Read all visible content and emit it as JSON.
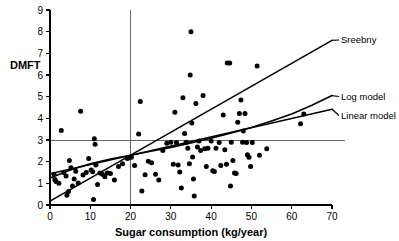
{
  "chart_data": {
    "type": "scatter",
    "title": "",
    "xlabel": "Sugar consumption (kg/year)",
    "ylabel": "DMFT",
    "xlim": [
      0,
      70
    ],
    "ylim": [
      0,
      9
    ],
    "xticks": [
      0,
      10,
      20,
      30,
      40,
      50,
      60,
      70
    ],
    "yticks": [
      0,
      1,
      2,
      3,
      4,
      5,
      6,
      7,
      8,
      9
    ],
    "grid": false,
    "legend_position": "right-inline-labels",
    "reference_lines": [
      {
        "name": "vertical-threshold",
        "orientation": "vertical",
        "value": 20
      },
      {
        "name": "horizontal-threshold",
        "orientation": "horizontal",
        "value": 3
      }
    ],
    "series": [
      {
        "name": "Sreebny",
        "type": "line",
        "label": "Sreebny",
        "points": [
          [
            0,
            0.18
          ],
          [
            70,
            7.6
          ]
        ]
      },
      {
        "name": "Log model",
        "type": "line",
        "label": "Log model",
        "points": [
          [
            0,
            1.25
          ],
          [
            5,
            1.62
          ],
          [
            10,
            1.9
          ],
          [
            15,
            2.12
          ],
          [
            20,
            2.3
          ],
          [
            25,
            2.48
          ],
          [
            30,
            2.66
          ],
          [
            35,
            2.86
          ],
          [
            40,
            3.08
          ],
          [
            45,
            3.32
          ],
          [
            50,
            3.58
          ],
          [
            55,
            3.88
          ],
          [
            60,
            4.2
          ],
          [
            65,
            4.6
          ],
          [
            70,
            5.05
          ]
        ]
      },
      {
        "name": "Linear model",
        "type": "line",
        "label": "Linear model",
        "points": [
          [
            0,
            1.44
          ],
          [
            70,
            4.42
          ]
        ]
      },
      {
        "name": "Countries",
        "type": "scatter",
        "label": "",
        "points": [
          [
            1.0,
            1.42
          ],
          [
            1.2,
            1.18
          ],
          [
            1.5,
            1.08
          ],
          [
            2.2,
            1.0
          ],
          [
            2.8,
            3.44
          ],
          [
            3.4,
            1.5
          ],
          [
            4.0,
            1.34
          ],
          [
            4.2,
            0.45
          ],
          [
            4.6,
            0.62
          ],
          [
            4.8,
            2.05
          ],
          [
            5.2,
            1.72
          ],
          [
            5.6,
            0.88
          ],
          [
            6.0,
            1.2
          ],
          [
            6.4,
            1.56
          ],
          [
            7.0,
            1.02
          ],
          [
            7.6,
            4.33
          ],
          [
            8.2,
            1.38
          ],
          [
            9.0,
            1.5
          ],
          [
            9.6,
            2.15
          ],
          [
            10.2,
            1.62
          ],
          [
            10.6,
            1.54
          ],
          [
            10.8,
            0.25
          ],
          [
            11.0,
            3.06
          ],
          [
            11.2,
            2.8
          ],
          [
            11.4,
            1.85
          ],
          [
            11.8,
            0.95
          ],
          [
            12.4,
            1.48
          ],
          [
            13.0,
            1.42
          ],
          [
            13.6,
            1.3
          ],
          [
            14.2,
            1.48
          ],
          [
            15.0,
            1.45
          ],
          [
            16.0,
            1.15
          ],
          [
            17.0,
            1.78
          ],
          [
            18.0,
            1.9
          ],
          [
            19.2,
            2.15
          ],
          [
            19.6,
            2.18
          ],
          [
            20.2,
            2.2
          ],
          [
            21.0,
            1.82
          ],
          [
            22.0,
            3.28
          ],
          [
            22.4,
            4.78
          ],
          [
            22.8,
            0.65
          ],
          [
            23.6,
            1.4
          ],
          [
            24.4,
            2.02
          ],
          [
            25.2,
            1.95
          ],
          [
            26.2,
            1.42
          ],
          [
            27.0,
            1.15
          ],
          [
            28.0,
            2.52
          ],
          [
            29.0,
            2.85
          ],
          [
            30.0,
            2.9
          ],
          [
            30.6,
            1.88
          ],
          [
            31.0,
            4.28
          ],
          [
            31.4,
            2.88
          ],
          [
            31.8,
            1.85
          ],
          [
            32.2,
            1.52
          ],
          [
            32.6,
            0.78
          ],
          [
            33.0,
            4.95
          ],
          [
            33.4,
            3.3
          ],
          [
            33.8,
            2.9
          ],
          [
            34.2,
            2.62
          ],
          [
            34.6,
            1.9
          ],
          [
            34.8,
            6.0
          ],
          [
            35.0,
            8.0
          ],
          [
            35.2,
            3.78
          ],
          [
            35.4,
            2.22
          ],
          [
            35.6,
            1.2
          ],
          [
            35.8,
            0.42
          ],
          [
            36.2,
            4.68
          ],
          [
            36.6,
            2.68
          ],
          [
            37.0,
            2.95
          ],
          [
            37.4,
            2.52
          ],
          [
            38.0,
            5.05
          ],
          [
            38.4,
            2.6
          ],
          [
            38.8,
            1.78
          ],
          [
            39.2,
            2.62
          ],
          [
            40.0,
            2.95
          ],
          [
            40.4,
            1.58
          ],
          [
            40.8,
            1.55
          ],
          [
            41.2,
            2.62
          ],
          [
            42.0,
            2.88
          ],
          [
            42.4,
            1.82
          ],
          [
            43.0,
            4.15
          ],
          [
            43.4,
            2.55
          ],
          [
            43.8,
            1.88
          ],
          [
            44.0,
            6.55
          ],
          [
            44.6,
            6.55
          ],
          [
            44.8,
            0.88
          ],
          [
            45.0,
            2.9
          ],
          [
            45.4,
            2.05
          ],
          [
            45.8,
            1.48
          ],
          [
            46.2,
            1.45
          ],
          [
            46.6,
            3.82
          ],
          [
            47.0,
            4.22
          ],
          [
            47.4,
            4.85
          ],
          [
            47.8,
            2.9
          ],
          [
            48.0,
            3.42
          ],
          [
            48.4,
            4.22
          ],
          [
            48.8,
            2.88
          ],
          [
            49.0,
            2.32
          ],
          [
            49.4,
            2.2
          ],
          [
            49.8,
            1.78
          ],
          [
            50.2,
            2.88
          ],
          [
            51.4,
            6.42
          ],
          [
            52.0,
            2.3
          ],
          [
            53.8,
            2.6
          ],
          [
            62.2,
            3.75
          ],
          [
            63.0,
            4.2
          ]
        ]
      }
    ]
  },
  "axis": {
    "y_tick_labels": [
      "0",
      "1",
      "2",
      "3",
      "4",
      "5",
      "6",
      "7",
      "8",
      "9"
    ],
    "x_tick_labels": [
      "0",
      "10",
      "20",
      "30",
      "40",
      "50",
      "60",
      "70"
    ],
    "y_title": "DMFT",
    "x_title": "Sugar consumption (kg/year)"
  },
  "annotations": {
    "sreebny_label": "Sreebny",
    "log_model_label": "Log model",
    "linear_model_label": "Linear model"
  },
  "colors": {
    "ink": "#000000",
    "reference_line": "#555555",
    "background": "#ffffff"
  }
}
